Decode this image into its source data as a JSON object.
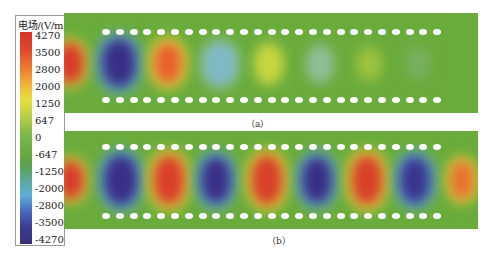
{
  "colorbar": {
    "title": "电场/(V/m)",
    "ticks": [
      "4270",
      "3500",
      "2800",
      "2000",
      "1250",
      "647",
      "0",
      "-647",
      "-1250",
      "-2000",
      "-2800",
      "-3500",
      "-4270"
    ],
    "colors": {
      "max": "#d9322b",
      "mid": "#6aac3f",
      "min": "#3a2f78"
    }
  },
  "panels": [
    {
      "label": "（a）",
      "caption": "（a）",
      "description": "Field decays along waveguide"
    },
    {
      "label": "（b）",
      "caption": "（b）",
      "description": "Field propagates along waveguide"
    }
  ],
  "chart_data": {
    "type": "heatmap",
    "title": "",
    "colorbar_label": "电场/(V/m)",
    "colorbar_range": [
      -4270,
      4270
    ],
    "colorbar_ticks": [
      4270,
      3500,
      2800,
      2000,
      1250,
      647,
      0,
      -647,
      -1250,
      -2000,
      -2800,
      -3500,
      -4270
    ],
    "panels": [
      {
        "label": "(a)",
        "holes_per_row": 25,
        "rows": 2,
        "field_lobes": [
          {
            "x_center": 70,
            "value": 4000
          },
          {
            "x_center": 118,
            "value": -4270
          },
          {
            "x_center": 170,
            "value": 3300
          },
          {
            "x_center": 221,
            "value": -1500
          },
          {
            "x_center": 271,
            "value": 1800
          },
          {
            "x_center": 321,
            "value": -900
          },
          {
            "x_center": 371,
            "value": 900
          },
          {
            "x_center": 420,
            "value": -300
          }
        ]
      },
      {
        "label": "(b)",
        "holes_per_row": 25,
        "rows": 2,
        "field_lobes": [
          {
            "x_center": 73,
            "value": 4000
          },
          {
            "x_center": 120,
            "value": -4270
          },
          {
            "x_center": 169,
            "value": 4000
          },
          {
            "x_center": 217,
            "value": -4270
          },
          {
            "x_center": 267,
            "value": 4000
          },
          {
            "x_center": 317,
            "value": -4270
          },
          {
            "x_center": 367,
            "value": 4000
          },
          {
            "x_center": 415,
            "value": -4000
          },
          {
            "x_center": 462,
            "value": 3500
          }
        ]
      }
    ]
  }
}
